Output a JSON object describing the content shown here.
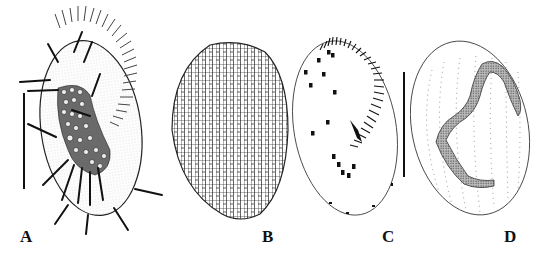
{
  "figure": {
    "panels": [
      {
        "id": "A",
        "label": "A",
        "subject": "ciliate-ventral-view-live",
        "features": [
          "adoral-membranelles",
          "cirri",
          "cytoplasmic-granules",
          "scale-bar"
        ]
      },
      {
        "id": "B",
        "label": "B",
        "subject": "ciliate-silverline-pattern",
        "features": [
          "polygonal-reticulum"
        ]
      },
      {
        "id": "C",
        "label": "C",
        "subject": "ciliate-infraciliature-ventral",
        "features": [
          "adoral-zone-of-membranelles",
          "cirri",
          "undulating-membrane",
          "scale-bar"
        ]
      },
      {
        "id": "D",
        "label": "D",
        "subject": "ciliate-dorsal-kineties-nuclear-apparatus",
        "features": [
          "dorsal-kineties-dotted",
          "macronucleus"
        ]
      }
    ],
    "scale_bars": [
      {
        "panel": "A"
      },
      {
        "panel": "C"
      }
    ],
    "colors": {
      "ink": "#1a1a1a",
      "background": "#ffffff",
      "stipple": "#888888"
    }
  }
}
